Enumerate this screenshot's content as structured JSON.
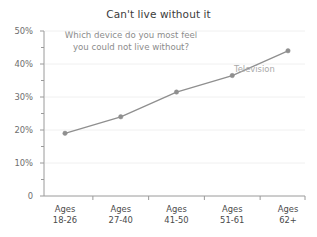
{
  "chart_data": {
    "type": "line",
    "title": "Can't live without it",
    "subtitle_line1": "Which device do you most feel",
    "subtitle_line2": "you could not live without?",
    "categories": [
      "Ages 18-26",
      "Ages 27-40",
      "Ages 41-50",
      "Ages 51-61",
      "Ages 62+"
    ],
    "category_lines": [
      {
        "top": "Ages",
        "bottom": "18-26"
      },
      {
        "top": "Ages",
        "bottom": "27-40"
      },
      {
        "top": "Ages",
        "bottom": "41-50"
      },
      {
        "top": "Ages",
        "bottom": "51-61"
      },
      {
        "top": "Ages",
        "bottom": "62+"
      }
    ],
    "series": [
      {
        "name": "Television",
        "values": [
          19,
          24,
          31.5,
          36.5,
          44
        ],
        "color": "#8f8f8f"
      }
    ],
    "xlabel": "",
    "ylabel": "",
    "ylim": [
      0,
      50
    ],
    "y_ticks": [
      0,
      10,
      20,
      30,
      40,
      50
    ],
    "y_tick_labels": [
      "0",
      "10%",
      "20%",
      "30%",
      "40%",
      "50%"
    ],
    "y_minor_tick_step": 5,
    "grid": true,
    "grid_color": "#f0f0f0",
    "legend_position": "inline-right",
    "axis_color": "#9a9a9a",
    "title_color": "#3b3b3b",
    "subtitle_color": "#8c8c8c",
    "background": "#ffffff"
  },
  "annotations": {
    "series_label": "Television"
  }
}
